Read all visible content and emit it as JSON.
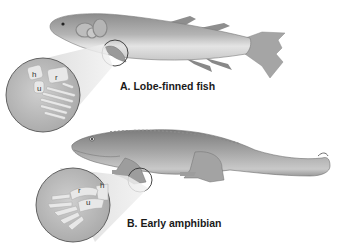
{
  "figure": {
    "panels": [
      {
        "id": "A",
        "label": "A. Lobe-finned fish",
        "animal": "lobe-finned fish",
        "inset_bones": [
          "h",
          "r",
          "u"
        ]
      },
      {
        "id": "B",
        "label": "B. Early amphibian",
        "animal": "early amphibian",
        "inset_bones": [
          "r",
          "h",
          "u"
        ]
      }
    ],
    "bone_labels": {
      "fish": {
        "h": "h",
        "r": "r",
        "u": "u"
      },
      "amphibian": {
        "h": "h",
        "r": "r",
        "u": "u"
      }
    }
  },
  "colors": {
    "background": "#ffffff",
    "animal_body": "#9a9a9a",
    "animal_light": "#d8d8d8",
    "animal_dark": "#6e6e6e",
    "inset_fill": "#b9b9b9",
    "bone_fill": "#e6e6e6",
    "outline": "#4a4a4a",
    "text": "#1a1a1a"
  }
}
